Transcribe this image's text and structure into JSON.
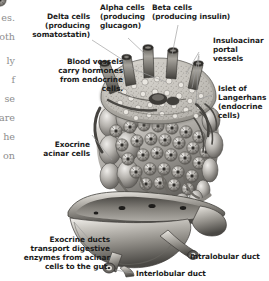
{
  "figure": {
    "background_color": "#ffffff",
    "ink_color": "#1b1b1b",
    "leader_color": "#9a9a9a"
  },
  "labels": {
    "delta_cells": "Delta cells\n(producing\nsomatostatin)",
    "alpha_cells": "Alpha cells\n(producing\nglucagon)",
    "beta_cells": "Beta cells\n(producing insulin)",
    "insuloacinar": "Insuloacinar\nportal\nvessels",
    "blood_vessels": "Blood vessels\ncarry hormones\nfrom endocrine\ncells.",
    "islet": "Islet of\nLangerhans\n(endocrine\ncells)",
    "exocrine_acinar": "Exocrine\nacinar cells",
    "exocrine_ducts": "Exocrine ducts\ntransport digestive\nenzymes from acinar\ncells to the gut.",
    "intralobular": "Intralobular duct",
    "interlobular": "Interlobular duct"
  },
  "bleed_column": {
    "fragments": [
      "es.",
      "oth",
      "ly",
      "f",
      "se",
      "are",
      "he",
      "on"
    ],
    "tops": [
      12,
      31,
      55,
      74,
      93,
      112,
      131,
      150
    ]
  }
}
